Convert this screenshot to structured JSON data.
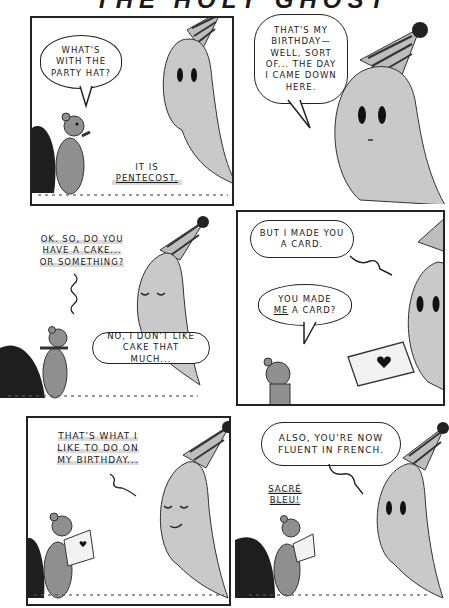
{
  "comic": {
    "title": "THE HOLY GHOST",
    "panels": [
      {
        "id": 1,
        "bordered": true,
        "dialogue": [
          {
            "speaker": "squirrel",
            "text": "WHAT'S WITH THE PARTY HAT?"
          },
          {
            "speaker": "ghost",
            "text_prefix": "IT IS",
            "text_emphasis": "PENTECOST."
          }
        ]
      },
      {
        "id": 2,
        "bordered": false,
        "dialogue": [
          {
            "speaker": "ghost",
            "text": "THAT'S MY BIRTHDAY— WELL, SORT OF... THE DAY I CAME DOWN HERE."
          }
        ]
      },
      {
        "id": 3,
        "bordered": false,
        "dialogue": [
          {
            "speaker": "squirrel",
            "text": "OK. SO, DO YOU HAVE A CAKE... OR SOMETHING?"
          },
          {
            "speaker": "ghost",
            "text": "NO, I DON'T LIKE CAKE THAT MUCH..."
          }
        ]
      },
      {
        "id": 4,
        "bordered": true,
        "dialogue": [
          {
            "speaker": "ghost",
            "text": "BUT I MADE YOU A CARD."
          },
          {
            "speaker": "squirrel",
            "text_prefix": "YOU MADE",
            "text_emphasis": "ME",
            "text_suffix": "A CARD?"
          }
        ]
      },
      {
        "id": 5,
        "bordered": true,
        "dialogue": [
          {
            "speaker": "squirrel",
            "text": "THAT'S WHAT I LIKE TO DO ON MY BIRTHDAY..."
          }
        ]
      },
      {
        "id": 6,
        "bordered": false,
        "dialogue": [
          {
            "speaker": "ghost",
            "text": "ALSO, YOU'RE NOW FLUENT IN FRENCH."
          },
          {
            "speaker": "squirrel",
            "text": "SACRÉ BLEU!"
          }
        ]
      }
    ],
    "characters": [
      "ghost-with-party-hat",
      "squirrel"
    ],
    "colors": {
      "ink": "#1a1a1a",
      "ghost": "#c9c9c9",
      "squirrel": "#8f8f8f",
      "tail": "#1e1e1e",
      "paper": "#ffffff"
    }
  }
}
